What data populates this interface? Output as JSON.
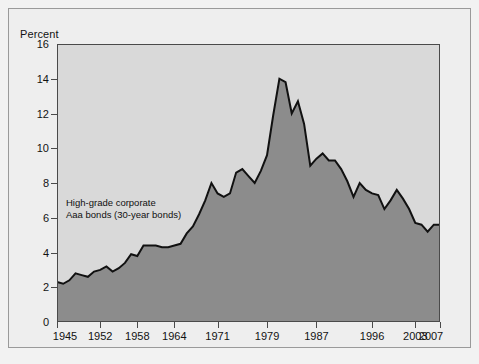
{
  "figure": {
    "background_color": "#f2f2f2",
    "frame_color": "#9a9a9a",
    "plot_background_color": "#d9d9d9",
    "axis_color": "#4a4a4a"
  },
  "chart_data": {
    "type": "area",
    "title": "",
    "subtitle": "",
    "ylabel": "Percent",
    "xlabel": "",
    "ylim": [
      0,
      16
    ],
    "xlim": [
      1945,
      2007
    ],
    "grid": false,
    "legend_position": "none",
    "line_color": "#111111",
    "fill_color": "#8c8c8c",
    "series_name": "High-grade corporate Aaa bonds (30-year bonds)",
    "annotation_lines": [
      "High-grade corporate",
      "Aaa bonds (30-year bonds)"
    ],
    "yticks": [
      0,
      2,
      4,
      6,
      8,
      10,
      12,
      14,
      16
    ],
    "ytick_labels": [
      "0",
      "2",
      "4",
      "6",
      "8",
      "10",
      "12",
      "14",
      "16"
    ],
    "xticks": [
      1945,
      1952,
      1958,
      1964,
      1971,
      1979,
      1987,
      1996,
      2003,
      2007
    ],
    "xtick_labels": [
      "1945",
      "1952",
      "1958",
      "1964",
      "1971",
      "1979",
      "1987",
      "1996",
      "2003",
      "2007"
    ],
    "x": [
      1945,
      1946,
      1947,
      1948,
      1949,
      1950,
      1951,
      1952,
      1953,
      1954,
      1955,
      1956,
      1957,
      1958,
      1959,
      1960,
      1961,
      1962,
      1963,
      1964,
      1965,
      1966,
      1967,
      1968,
      1969,
      1970,
      1971,
      1972,
      1973,
      1974,
      1975,
      1976,
      1977,
      1978,
      1979,
      1980,
      1981,
      1982,
      1983,
      1984,
      1985,
      1986,
      1987,
      1988,
      1989,
      1990,
      1991,
      1992,
      1993,
      1994,
      1995,
      1996,
      1997,
      1998,
      1999,
      2000,
      2001,
      2002,
      2003,
      2004,
      2005,
      2006,
      2007
    ],
    "values": [
      2.3,
      2.2,
      2.4,
      2.8,
      2.7,
      2.6,
      2.9,
      3.0,
      3.2,
      2.9,
      3.1,
      3.4,
      3.9,
      3.8,
      4.4,
      4.4,
      4.4,
      4.3,
      4.3,
      4.4,
      4.5,
      5.1,
      5.5,
      6.2,
      7.0,
      8.0,
      7.4,
      7.2,
      7.4,
      8.6,
      8.8,
      8.4,
      8.0,
      8.7,
      9.6,
      11.9,
      14.0,
      13.8,
      12.0,
      12.7,
      11.4,
      9.0,
      9.4,
      9.7,
      9.3,
      9.3,
      8.8,
      8.1,
      7.2,
      8.0,
      7.6,
      7.4,
      7.3,
      6.5,
      7.0,
      7.6,
      7.1,
      6.5,
      5.7,
      5.6,
      5.2,
      5.6,
      5.6
    ]
  }
}
